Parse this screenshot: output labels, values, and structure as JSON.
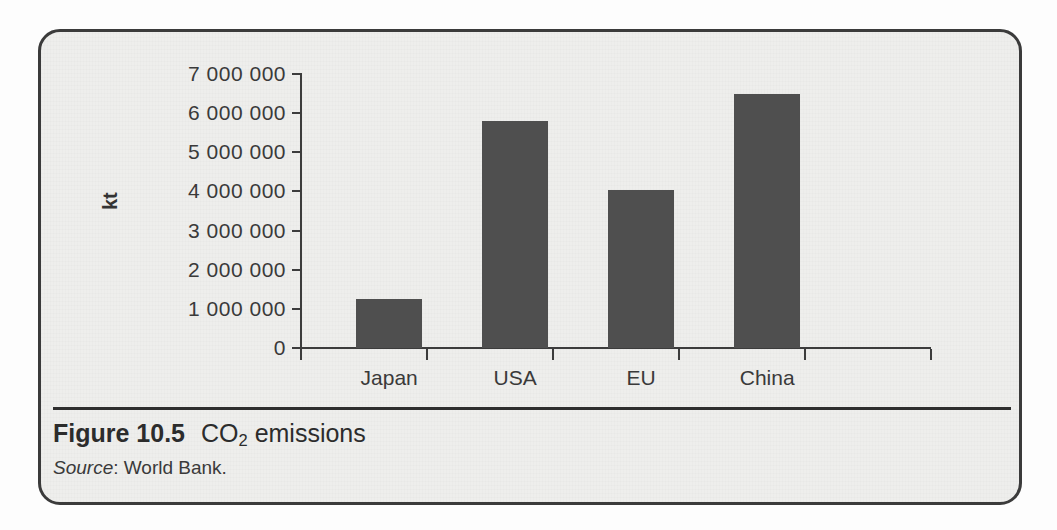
{
  "figure": {
    "number_label": "Figure 10.5",
    "title_main": "CO",
    "title_subscript": "2",
    "title_rest": " emissions",
    "source_label": "Source",
    "source_separator": ": ",
    "source_value": "World Bank."
  },
  "colors": {
    "bar_fill": "#4f4f4f",
    "axis": "#3c3c3c",
    "frame_border": "#3b3b3b",
    "page_background": "#eeeeec",
    "text": "#2c2c2c"
  },
  "chart_data": {
    "type": "bar",
    "title": "CO2 emissions",
    "xlabel": "",
    "ylabel": "kt",
    "categories": [
      "Japan",
      "USA",
      "EU",
      "China"
    ],
    "values": [
      1250000,
      5810000,
      4030000,
      6480000
    ],
    "ylim": [
      0,
      7000000
    ],
    "ytick_values": [
      0,
      1000000,
      2000000,
      3000000,
      4000000,
      5000000,
      6000000,
      7000000
    ],
    "ytick_labels": [
      "0",
      "1 000 000",
      "2 000 000",
      "3 000 000",
      "4 000 000",
      "5 000 000",
      "6 000 000",
      "7 000 000"
    ],
    "grid": false,
    "legend": false,
    "legend_position": "none",
    "series": [
      {
        "name": "CO2 emissions",
        "values": [
          1250000,
          5810000,
          4030000,
          6480000
        ]
      }
    ],
    "annotations": []
  }
}
